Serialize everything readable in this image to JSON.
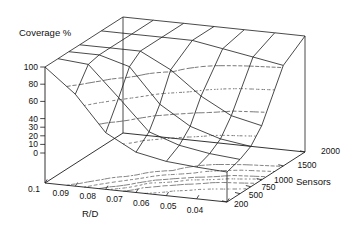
{
  "chart_data": {
    "type": "surface3d_wireframe",
    "title": "Coverage %",
    "x_axis": {
      "label": "R/D",
      "values": [
        0.1,
        0.09,
        0.08,
        0.07,
        0.06,
        0.05,
        0.04
      ],
      "tick_labels": [
        "0.1",
        "0.09",
        "0.08",
        "0.07",
        "0.06",
        "0.05",
        "0.04"
      ]
    },
    "y_axis": {
      "label": "Sensors",
      "values": [
        200,
        500,
        750,
        1000,
        1500,
        2000
      ],
      "tick_labels": [
        "200",
        "500",
        "750",
        "1000",
        "1500",
        "2000"
      ]
    },
    "z_axis": {
      "label": "Coverage %",
      "range": [
        0,
        100
      ],
      "values": [
        0,
        10,
        20,
        30,
        40,
        60,
        80,
        100
      ],
      "tick_labels": [
        "0",
        "10",
        "20",
        "30",
        "40",
        "60",
        "80",
        "100"
      ]
    },
    "surface": {
      "r_over_d": [
        0.1,
        0.09,
        0.08,
        0.07,
        0.06,
        0.05,
        0.04
      ],
      "sensors": [
        200,
        500,
        750,
        1000,
        1500,
        2000
      ],
      "coverage_percent": [
        [
          100,
          100,
          100,
          100,
          100,
          100
        ],
        [
          72,
          97,
          100,
          100,
          100,
          100
        ],
        [
          31,
          62,
          90,
          100,
          100,
          100
        ],
        [
          12,
          26,
          50,
          82,
          100,
          100
        ],
        [
          5,
          14,
          28,
          55,
          94,
          100
        ],
        [
          2,
          8,
          17,
          36,
          88,
          100
        ],
        [
          0,
          5,
          12,
          28,
          82,
          100
        ]
      ]
    },
    "contour_levels_surface": [
      20,
      40,
      60,
      80
    ],
    "contour_levels_base": [
      10,
      20,
      30,
      40,
      60,
      80
    ],
    "legend": "none",
    "grid": "wireframe with dashed contour lines on surface and base",
    "colors": {
      "line": "#1c1c1c",
      "contour": "#2e2e2e",
      "text": "#111111",
      "background": "#ffffff"
    }
  }
}
